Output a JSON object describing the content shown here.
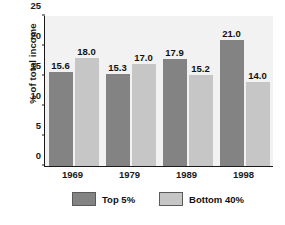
{
  "chart_data": {
    "type": "bar",
    "title": "",
    "xlabel": "",
    "ylabel": "% of total income",
    "ylim": [
      0,
      25
    ],
    "yticks": [
      0,
      5,
      10,
      15,
      20,
      25
    ],
    "ytick_labels": [
      "0",
      "5",
      "10",
      "15",
      "20",
      "25"
    ],
    "grid": false,
    "legend_position": "bottom",
    "categories": [
      "1969",
      "1979",
      "1989",
      "1998"
    ],
    "series": [
      {
        "name": "Top 5%",
        "color": "#838383",
        "values": [
          15.6,
          15.3,
          17.9,
          21.0
        ],
        "labels": [
          "15.6",
          "15.3",
          "17.9",
          "21.0"
        ]
      },
      {
        "name": "Bottom 40%",
        "color": "#c6c6c6",
        "values": [
          18.0,
          17.0,
          15.2,
          14.0
        ],
        "labels": [
          "18.0",
          "17.0",
          "15.2",
          "14.0"
        ]
      }
    ]
  },
  "legend": {
    "items": [
      {
        "label": "Top 5%",
        "color": "#838383"
      },
      {
        "label": "Bottom 40%",
        "color": "#c6c6c6"
      }
    ]
  },
  "colors": {
    "plot_background": "#f2f2f2",
    "axis": "#1a1a1a",
    "dark_bar": "#838383",
    "light_bar": "#c6c6c6"
  }
}
